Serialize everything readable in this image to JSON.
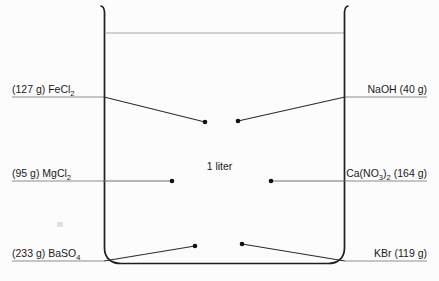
{
  "figure": {
    "center_label": "1 liter",
    "vessel": {
      "name": "beaker",
      "capacity_label": "1 liter",
      "liquid_line_visible": true
    },
    "colors": {
      "background": "#fcfcfc",
      "outline": "#1f1f1f",
      "liquid_line": "#9a9a9a",
      "leader_line": "#2b2b2b",
      "rule": "#8c8c8c",
      "text": "#1a1a1a"
    },
    "labels_left": [
      {
        "id": "fecl2",
        "text": "(127 g) FeCl",
        "subscript": "2",
        "amount": "127 g",
        "formula": "FeCl2",
        "leader": "diagonal-down-right",
        "dot_x": 205,
        "dot_y": 122
      },
      {
        "id": "mgcl2",
        "text": "(95 g) MgCl",
        "subscript": "2",
        "amount": "95 g",
        "formula": "MgCl2",
        "leader": "horizontal",
        "dot_x": 172,
        "dot_y": 181
      },
      {
        "id": "baso4",
        "text": "(233 g) BaSO",
        "subscript": "4",
        "amount": "233 g",
        "formula": "BaSO4",
        "leader": "diagonal-up-right",
        "dot_x": 195,
        "dot_y": 246
      }
    ],
    "labels_right": [
      {
        "id": "naoh",
        "text": "NaOH (40 g)",
        "amount": "40 g",
        "formula": "NaOH",
        "leader": "diagonal-down-left",
        "dot_x": 238,
        "dot_y": 121
      },
      {
        "id": "cano3",
        "text_pre": "Ca(NO",
        "sub_1": "3",
        "text_mid": ")",
        "sub_2": "2",
        "text_post": " (164 g)",
        "amount": "164 g",
        "formula": "Ca(NO3)2",
        "leader": "horizontal",
        "dot_x": 271,
        "dot_y": 181
      },
      {
        "id": "kbr",
        "text": "KBr (119 g)",
        "amount": "119 g",
        "formula": "KBr",
        "leader": "diagonal-up-left",
        "dot_x": 242,
        "dot_y": 244
      }
    ]
  }
}
